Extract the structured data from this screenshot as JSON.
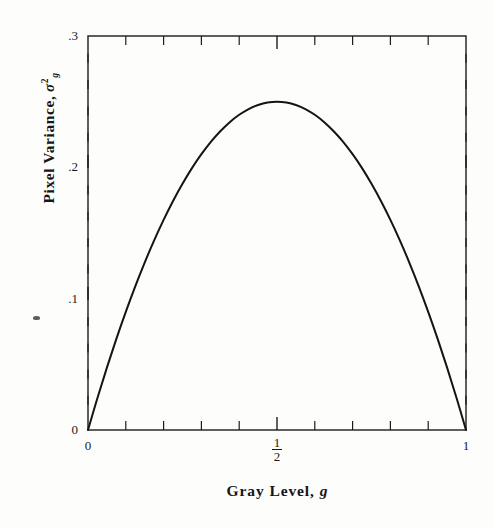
{
  "figure": {
    "background_color": "#fdfdfc",
    "axis_color": "#1c1c1c",
    "curve_color": "#141414"
  },
  "chart_data": {
    "type": "line",
    "title": "",
    "subtitle": "",
    "xlabel": "Gray Level, g",
    "ylabel": "Pixel Variance, σ²g",
    "ylabel_parts": {
      "text": "Pixel Variance,",
      "symbol": "σ",
      "superscript": "2",
      "subscript": "g"
    },
    "xlabel_parts": {
      "text": "Gray Level,",
      "symbol": "g"
    },
    "xlim": [
      0,
      1
    ],
    "ylim": [
      0,
      0.3
    ],
    "grid": false,
    "legend": null,
    "x_major_ticks": [
      0,
      0.5,
      1
    ],
    "x_major_tick_labels": [
      "0",
      "1/2",
      "1"
    ],
    "x_minor_tick_count": 10,
    "y_major_ticks": [
      0,
      0.1,
      0.2,
      0.3
    ],
    "y_major_tick_labels": [
      "0",
      ".1",
      ".2",
      ".3"
    ],
    "y_minor_tick_count": 15,
    "series": [
      {
        "name": "g(1-g)",
        "x": [
          0.0,
          0.025,
          0.05,
          0.075,
          0.1,
          0.125,
          0.15,
          0.175,
          0.2,
          0.225,
          0.25,
          0.275,
          0.3,
          0.325,
          0.35,
          0.375,
          0.4,
          0.425,
          0.45,
          0.475,
          0.5,
          0.525,
          0.55,
          0.575,
          0.6,
          0.625,
          0.65,
          0.675,
          0.7,
          0.725,
          0.75,
          0.775,
          0.8,
          0.825,
          0.85,
          0.875,
          0.9,
          0.925,
          0.95,
          0.975,
          1.0
        ],
        "values": [
          0.0,
          0.0244,
          0.0475,
          0.0694,
          0.09,
          0.1094,
          0.1275,
          0.1444,
          0.16,
          0.1744,
          0.1875,
          0.1994,
          0.21,
          0.2194,
          0.2275,
          0.2344,
          0.24,
          0.2444,
          0.2475,
          0.2494,
          0.25,
          0.2494,
          0.2475,
          0.2444,
          0.24,
          0.2344,
          0.2275,
          0.2194,
          0.21,
          0.1994,
          0.1875,
          0.1744,
          0.16,
          0.1444,
          0.1275,
          0.1094,
          0.09,
          0.0694,
          0.0475,
          0.0244,
          0.0
        ]
      }
    ],
    "peak": {
      "x": 0.5,
      "y": 0.25
    },
    "annotations": []
  }
}
